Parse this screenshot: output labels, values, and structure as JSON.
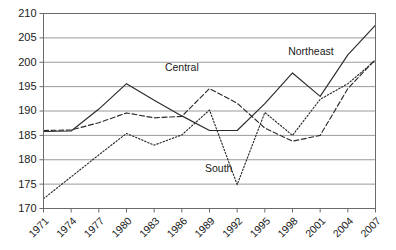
{
  "chart_data": {
    "type": "line",
    "title": "",
    "xlabel": "",
    "ylabel": "",
    "ylim": [
      170,
      210
    ],
    "ytick_step": 5,
    "yticks": [
      170,
      175,
      180,
      185,
      190,
      195,
      200,
      205,
      210
    ],
    "grid": true,
    "grid_axis": "y",
    "legend_position": "inline-annotations",
    "x": [
      1971,
      1974,
      1977,
      1980,
      1983,
      1986,
      1989,
      1992,
      1995,
      1998,
      2001,
      2004,
      2007
    ],
    "xticks": [
      "1971",
      "1974",
      "1977",
      "1980",
      "1983",
      "1986",
      "1989",
      "1992",
      "1995",
      "1998",
      "2001",
      "2004",
      "2007"
    ],
    "xtick_rotation": -45,
    "series": [
      {
        "name": "Northeast",
        "style": "solid",
        "label_x": 2000,
        "label_y": 201.5,
        "values": [
          185.8,
          185.9,
          190.4,
          195.6,
          192.2,
          189.0,
          186.0,
          186.0,
          191.5,
          197.8,
          193.0,
          201.5,
          207.6
        ]
      },
      {
        "name": "Central",
        "style": "dashed",
        "label_x": 1986,
        "label_y": 198.3,
        "values": [
          186.0,
          186.1,
          187.6,
          189.6,
          188.6,
          188.9,
          194.6,
          191.6,
          186.5,
          183.8,
          185.0,
          194.6,
          200.6
        ]
      },
      {
        "name": "South",
        "style": "dotted",
        "label_x": 1990,
        "label_y": 177.5,
        "values": [
          172.0,
          176.5,
          181.0,
          185.4,
          183.0,
          185.1,
          190.2,
          174.9,
          189.7,
          185.0,
          192.4,
          195.6,
          200.4
        ]
      }
    ]
  }
}
